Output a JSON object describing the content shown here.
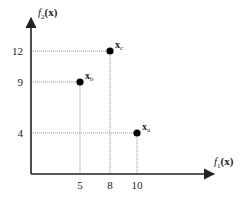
{
  "chart_data": {
    "type": "scatter",
    "title": "",
    "xlabel": "f1(x)",
    "ylabel": "f2(x)",
    "x_ticks": [
      5,
      8,
      10
    ],
    "y_ticks": [
      4,
      9,
      12
    ],
    "grid": false,
    "legend": null,
    "points": [
      {
        "name": "x_a",
        "label": "x",
        "sub": "a",
        "x": 10,
        "y": 4
      },
      {
        "name": "x_b",
        "label": "x",
        "sub": "b",
        "x": 5,
        "y": 9
      },
      {
        "name": "x_c",
        "label": "x",
        "sub": "c",
        "x": 8,
        "y": 12
      }
    ],
    "guides": "dotted projection lines from each point to both axes"
  },
  "axes": {
    "x_label_f": "f",
    "x_label_sub": "1",
    "x_label_arg": "(x)",
    "y_label_f": "f",
    "y_label_sub": "2",
    "y_label_arg": "(x)"
  },
  "colors": {
    "axis": "#222222",
    "guide": "#888888",
    "point": "#000000"
  }
}
